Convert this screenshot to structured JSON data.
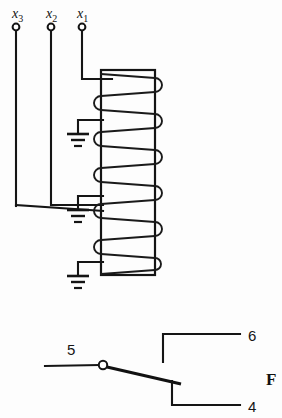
{
  "figure": {
    "kind": "electrical-schematic",
    "background_color": "#fdfdfd",
    "ink_color": "#141414"
  },
  "inputs": {
    "terminals": [
      {
        "id": "x3",
        "base": "x",
        "subscript": "3",
        "label_x": 12,
        "label_y": 18,
        "node_x": 16,
        "node_y": 27
      },
      {
        "id": "x2",
        "base": "x",
        "subscript": "2",
        "label_x": 46,
        "label_y": 18,
        "node_x": 51,
        "node_y": 27
      },
      {
        "id": "x1",
        "base": "x",
        "subscript": "1",
        "label_x": 77,
        "label_y": 18,
        "node_x": 82,
        "node_y": 27
      }
    ],
    "node_radius": 3.4
  },
  "core": {
    "left": 101,
    "right": 155,
    "top": 70,
    "bottom": 275
  },
  "winding": {
    "turn_count": 7,
    "left_bump_radius": 6,
    "right_bump_radius": 6
  },
  "grounds": [
    {
      "id": "ground-upper",
      "stem_x": 78,
      "stem_top": 120,
      "stem_bottom": 134,
      "bars": [
        22,
        14,
        8
      ],
      "bar_gap": 5
    },
    {
      "id": "ground-middle",
      "stem_x": 78,
      "stem_top": 196,
      "stem_bottom": 210,
      "bars": [
        22,
        14,
        8
      ],
      "bar_gap": 5
    },
    {
      "id": "ground-lower",
      "stem_x": 78,
      "stem_top": 262,
      "stem_bottom": 276,
      "bars": [
        22,
        14,
        8
      ],
      "bar_gap": 5
    }
  ],
  "switch": {
    "pivot": {
      "x": 103,
      "y": 365,
      "radius": 4.2
    },
    "lead_left_x": 45,
    "blade_end": {
      "x": 178,
      "y": 383
    },
    "pole_label": {
      "text": "5",
      "x": 67,
      "y": 355
    },
    "terminal_no_label": {
      "text": "6",
      "x": 248,
      "y": 341
    },
    "terminal_nc_label": {
      "text": "4",
      "x": 248,
      "y": 412
    },
    "terminal_no_path": {
      "stub_x": 163,
      "stub_bottom": 362,
      "rail_y": 334,
      "rail_end_x": 240
    },
    "terminal_nc_path": {
      "stub_x": 172,
      "stub_top": 381,
      "rail_y": 405,
      "rail_end_x": 240
    }
  },
  "caption": {
    "text": "F",
    "x": 266,
    "y": 385,
    "note": "partially clipped figure caption at right edge"
  }
}
